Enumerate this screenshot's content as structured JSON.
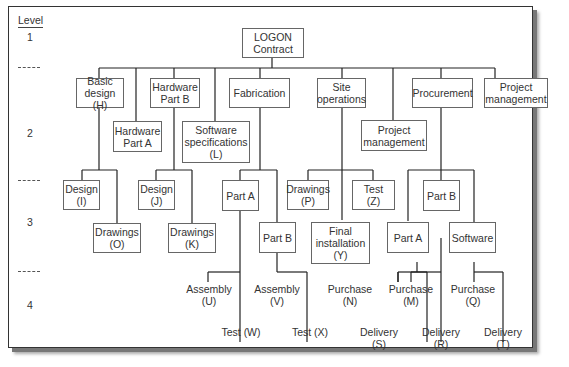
{
  "levels": {
    "header": "Level",
    "items": [
      "1",
      "2",
      "3",
      "4"
    ]
  },
  "root": {
    "label": "LOGON\nContract"
  },
  "level2": [
    {
      "id": "basic-design",
      "label": "Basic\ndesign (H)"
    },
    {
      "id": "hardware-part-a",
      "label": "Hardware\nPart A"
    },
    {
      "id": "hardware-part-b",
      "label": "Hardware\nPart B"
    },
    {
      "id": "software-specifications",
      "label": "Software\nspecifications\n(L)"
    },
    {
      "id": "fabrication",
      "label": "Fabrication"
    },
    {
      "id": "site-operations",
      "label": "Site\noperations"
    },
    {
      "id": "project-management-2",
      "label": "Project\nmanagement"
    },
    {
      "id": "procurement",
      "label": "Procurement"
    },
    {
      "id": "project-management",
      "label": "Project\nmanagement"
    }
  ],
  "level3": [
    {
      "id": "design-i",
      "label": "Design\n(I)",
      "parent": "basic-design"
    },
    {
      "id": "drawings-o",
      "label": "Drawings\n(O)",
      "parent": "basic-design"
    },
    {
      "id": "design-j",
      "label": "Design\n(J)",
      "parent": "hardware-part-b"
    },
    {
      "id": "drawings-k",
      "label": "Drawings\n(K)",
      "parent": "hardware-part-b"
    },
    {
      "id": "fab-part-a",
      "label": "Part A",
      "parent": "fabrication"
    },
    {
      "id": "fab-part-b",
      "label": "Part B",
      "parent": "fabrication"
    },
    {
      "id": "drawings-p",
      "label": "Drawings\n(P)",
      "parent": "site-operations"
    },
    {
      "id": "test-z",
      "label": "Test\n(Z)",
      "parent": "site-operations"
    },
    {
      "id": "final-installation-y",
      "label": "Final\ninstallation\n(Y)",
      "parent": "site-operations"
    },
    {
      "id": "proc-part-a",
      "label": "Part A",
      "parent": "procurement"
    },
    {
      "id": "proc-part-b",
      "label": "Part B",
      "parent": "procurement"
    },
    {
      "id": "proc-software",
      "label": "Software",
      "parent": "procurement"
    }
  ],
  "level4": [
    {
      "id": "assembly-u",
      "label": "Assembly\n(U)",
      "parent": "fab-part-a"
    },
    {
      "id": "test-w",
      "label": "Test (W)",
      "parent": "fab-part-a"
    },
    {
      "id": "assembly-v",
      "label": "Assembly\n(V)",
      "parent": "fab-part-b"
    },
    {
      "id": "test-x",
      "label": "Test (X)",
      "parent": "fab-part-b"
    },
    {
      "id": "purchase-n",
      "label": "Purchase\n(N)",
      "parent": "proc-part-a"
    },
    {
      "id": "delivery-s",
      "label": "Delivery\n(S)",
      "parent": "proc-part-a"
    },
    {
      "id": "purchase-m",
      "label": "Purchase\n(M)",
      "parent": "proc-part-b"
    },
    {
      "id": "delivery-r",
      "label": "Delivery\n(R)",
      "parent": "proc-part-b"
    },
    {
      "id": "purchase-q",
      "label": "Purchase\n(Q)",
      "parent": "proc-software"
    },
    {
      "id": "delivery-t",
      "label": "Delivery\n(T)",
      "parent": "proc-software"
    }
  ]
}
